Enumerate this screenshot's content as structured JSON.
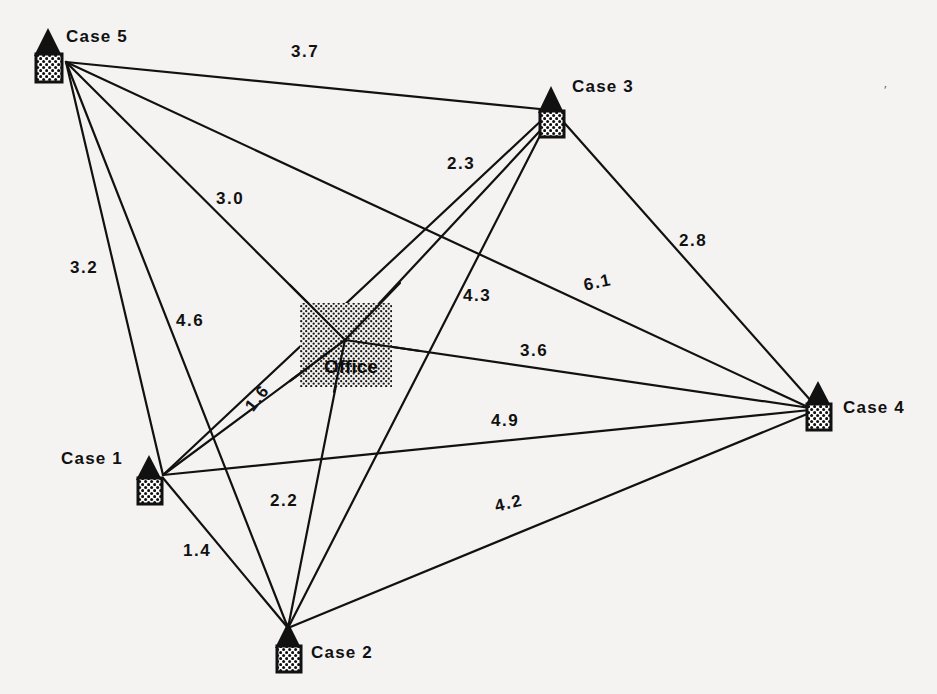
{
  "diagram": {
    "background_color": "#f4f3f1",
    "ink_color": "#111111"
  },
  "nodes": [
    {
      "id": "case5",
      "label": "Case 5",
      "icon": "house-icon",
      "house_x": 34,
      "house_y": 30,
      "anchor_x": 66,
      "anchor_y": 62,
      "label_x": 66,
      "label_y": 30
    },
    {
      "id": "case3",
      "label": "Case 3",
      "icon": "house-icon",
      "house_x": 540,
      "house_y": 88,
      "anchor_x": 556,
      "anchor_y": 118,
      "label_x": 572,
      "label_y": 80
    },
    {
      "id": "case4",
      "label": "Case 4",
      "icon": "house-icon",
      "house_x": 804,
      "house_y": 383,
      "anchor_x": 810,
      "anchor_y": 408,
      "label_x": 843,
      "label_y": 400
    },
    {
      "id": "case1",
      "label": "Case 1",
      "icon": "house-icon",
      "house_x": 135,
      "house_y": 455,
      "anchor_x": 163,
      "anchor_y": 475,
      "label_x": 62,
      "label_y": 452
    },
    {
      "id": "case2",
      "label": "Case 2",
      "icon": "house-icon",
      "house_x": 268,
      "house_y": 625,
      "anchor_x": 288,
      "anchor_y": 628,
      "label_x": 310,
      "label_y": 645
    },
    {
      "id": "office",
      "label": "Office",
      "icon": "office-patch-icon",
      "patch_x": 300,
      "patch_y": 303,
      "patch_w": 92,
      "patch_h": 84,
      "anchor_x": 345,
      "anchor_y": 340,
      "label_x": 326,
      "label_y": 360
    }
  ],
  "edges": [
    {
      "from": "case5",
      "to": "case3",
      "label": "3.7",
      "label_x": 291,
      "label_y": 44,
      "rotate": 0
    },
    {
      "from": "case5",
      "to": "case4",
      "label": "3.0",
      "label_x": 216,
      "label_y": 191,
      "rotate": 0
    },
    {
      "from": "case5",
      "to": "case1",
      "label": "3.2",
      "label_x": 71,
      "label_y": 260,
      "rotate": 0
    },
    {
      "from": "case5",
      "to": "case2",
      "label": "4.6",
      "label_x": 176,
      "label_y": 313,
      "rotate": 0
    },
    {
      "from": "case3",
      "to": "case2",
      "label": "2.3",
      "label_x": 447,
      "label_y": 156,
      "rotate": 0
    },
    {
      "from": "case3",
      "to": "case4",
      "label": "2.8",
      "label_x": 679,
      "label_y": 233,
      "rotate": 0
    },
    {
      "from": "case3",
      "to": "case1",
      "label": "4.3",
      "label_x": 463,
      "label_y": 288,
      "rotate": 0
    },
    {
      "from": "case5",
      "to": "case4_long",
      "label": "6.1",
      "label_x": 582,
      "label_y": 278,
      "rotate": -12
    },
    {
      "from": "office",
      "to": "case4",
      "label": "3.6",
      "label_x": 520,
      "label_y": 343,
      "rotate": 0
    },
    {
      "from": "case1",
      "to": "case4",
      "label": "4.9",
      "label_x": 491,
      "label_y": 413,
      "rotate": 0
    },
    {
      "from": "office",
      "to": "case1",
      "label": "1.6",
      "label_x": 242,
      "label_y": 404,
      "rotate": -52
    },
    {
      "from": "office",
      "to": "case2",
      "label": "2.2",
      "label_x": 270,
      "label_y": 493,
      "rotate": 0
    },
    {
      "from": "case1",
      "to": "case2",
      "label": "1.4",
      "label_x": 183,
      "label_y": 543,
      "rotate": 0
    },
    {
      "from": "case2",
      "to": "case4",
      "label": "4.2",
      "label_x": 493,
      "label_y": 498,
      "rotate": -13
    }
  ],
  "distances": {
    "case5_case3": 3.7,
    "case5_case4": 3.0,
    "case5_case1": 3.2,
    "case5_case2": 4.6,
    "case3_case2": 2.3,
    "case3_case4": 2.8,
    "case3_case1": 4.3,
    "case5_case4_alt": 6.1,
    "office_case4": 3.6,
    "case1_case4": 4.9,
    "office_case1": 1.6,
    "office_case2": 2.2,
    "case1_case2": 1.4,
    "case2_case4": 4.2
  },
  "artifacts": {
    "stray_mark_1": "′",
    "stray_mark_1_x": 884,
    "stray_mark_1_y": 85
  }
}
